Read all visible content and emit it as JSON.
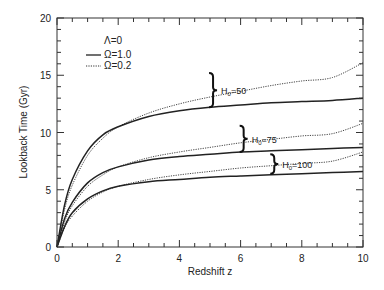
{
  "chart_data": {
    "type": "line",
    "title": "",
    "xlabel": "Redshift z",
    "ylabel": "Lookback Time (Gyr)",
    "xlim": [
      0,
      10
    ],
    "ylim": [
      0,
      20
    ],
    "xticks": [
      0,
      2,
      4,
      6,
      8,
      10
    ],
    "yticks": [
      0,
      5,
      10,
      15,
      20
    ],
    "grid": false,
    "legend": {
      "position": "upper-left",
      "title": "Λ=0",
      "entries": [
        {
          "label": "Ω=1.0",
          "style": "solid"
        },
        {
          "label": "Ω=0.2",
          "style": "dotted"
        }
      ]
    },
    "x": [
      0,
      0.25,
      0.5,
      1,
      1.5,
      2,
      3,
      4,
      5,
      6,
      7,
      8,
      9,
      10
    ],
    "series": [
      {
        "name": "H0=50, Ω=0.2",
        "style": "dotted",
        "values": [
          0,
          3.3,
          5.4,
          8.0,
          9.5,
          10.5,
          11.7,
          12.5,
          13.1,
          13.6,
          14.1,
          14.5,
          14.8,
          16.1
        ]
      },
      {
        "name": "H0=50, Ω=1.0",
        "style": "solid",
        "values": [
          0,
          3.7,
          5.9,
          8.4,
          9.8,
          10.5,
          11.4,
          11.9,
          12.2,
          12.4,
          12.6,
          12.7,
          12.8,
          13.0
        ]
      },
      {
        "name": "H0=75, Ω=0.2",
        "style": "dotted",
        "values": [
          0,
          2.2,
          3.6,
          5.3,
          6.3,
          7.0,
          7.8,
          8.3,
          8.7,
          9.1,
          9.4,
          9.7,
          9.9,
          10.8
        ]
      },
      {
        "name": "H0=75, Ω=1.0",
        "style": "solid",
        "values": [
          0,
          2.5,
          3.9,
          5.6,
          6.5,
          7.0,
          7.6,
          7.9,
          8.1,
          8.3,
          8.4,
          8.5,
          8.6,
          8.7
        ]
      },
      {
        "name": "H0=100, Ω=0.2",
        "style": "dotted",
        "values": [
          0,
          1.7,
          2.7,
          4.0,
          4.8,
          5.3,
          5.9,
          6.3,
          6.6,
          6.9,
          7.1,
          7.3,
          7.5,
          8.3
        ]
      },
      {
        "name": "H0=100, Ω=1.0",
        "style": "solid",
        "values": [
          0,
          1.8,
          3.0,
          4.2,
          4.9,
          5.3,
          5.7,
          5.9,
          6.1,
          6.2,
          6.3,
          6.4,
          6.5,
          6.6
        ]
      }
    ],
    "annotations": [
      {
        "text": "H0=50",
        "label_main": "H",
        "label_sub": "0",
        "label_rest": "=50",
        "x": 5.1,
        "y_range": [
          12.2,
          15.2
        ]
      },
      {
        "text": "H0=75",
        "label_main": "H",
        "label_sub": "0",
        "label_rest": "=75",
        "x": 6.1,
        "y_range": [
          8.3,
          10.6
        ]
      },
      {
        "text": "H0=100",
        "label_main": "H",
        "label_sub": "0",
        "label_rest": "=100",
        "x": 7.1,
        "y_range": [
          6.4,
          8.1
        ]
      }
    ]
  }
}
